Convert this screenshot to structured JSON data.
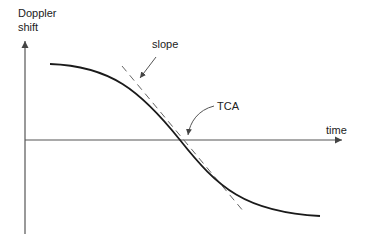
{
  "diagram": {
    "y_axis_label_line1": "Doppler",
    "y_axis_label_line2": "shift",
    "x_axis_label": "time",
    "slope_label": "slope",
    "tca_label": "TCA",
    "colors": {
      "curve": "#1a1a1a",
      "axis": "#555555",
      "tangent": "#666666",
      "text": "#222222"
    }
  }
}
